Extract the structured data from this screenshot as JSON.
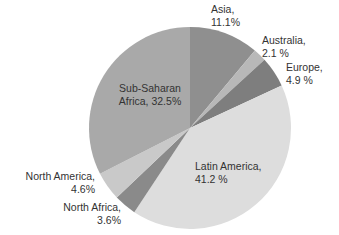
{
  "chart_data": {
    "type": "pie",
    "title": "",
    "start_angle_deg": 0,
    "direction": "clockwise",
    "categories": [
      "Asia",
      "Australia",
      "Europe",
      "Latin America",
      "North Africa",
      "North America",
      "Sub-Saharan Africa"
    ],
    "values": [
      11.1,
      2.1,
      4.9,
      41.2,
      3.6,
      4.6,
      32.5
    ],
    "unit": "%",
    "colors": [
      "#8f8f8f",
      "#b8b8b8",
      "#7e7e7e",
      "#dddddd",
      "#8a8a8a",
      "#c9c9c9",
      "#a9a9a9"
    ],
    "labels": [
      {
        "line1": "Asia,",
        "line2": "11.1%"
      },
      {
        "line1": "Australia,",
        "line2": "2.1 %"
      },
      {
        "line1": "Europe,",
        "line2": "4.9 %"
      },
      {
        "line1": "Latin America,",
        "line2": "41.2 %"
      },
      {
        "line1": "North Africa,",
        "line2": "3.6%"
      },
      {
        "line1": "North America,",
        "line2": "4.6%"
      },
      {
        "line1": "Sub-Saharan",
        "line2": "Africa, 32.5%"
      }
    ],
    "legend": "none"
  }
}
